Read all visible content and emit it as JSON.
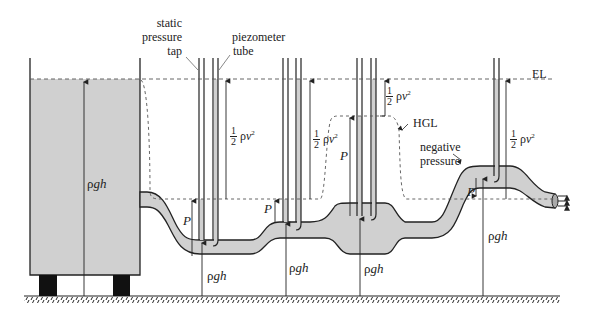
{
  "diagram": {
    "title": "",
    "type": "fluid flow pressure diagram",
    "labels": {
      "static_pressure_tap": [
        "static",
        "pressure",
        "tap"
      ],
      "piezometer_tube": [
        "piezometer",
        "tube"
      ],
      "energy_line": "EL",
      "hydraulic_grade_line": "HGL",
      "negative_pressure": [
        "negative",
        "pressure"
      ],
      "pressure_symbol": "P",
      "hydrostatic": {
        "rho": "ρ",
        "g": "g",
        "h": "h"
      },
      "dynamic": {
        "half_num": "1",
        "half_den": "2",
        "rho": "ρ",
        "v": "v",
        "exp": "2"
      }
    },
    "colors": {
      "fluid_fill": "#d0d0d0",
      "line": "#222222",
      "dashed": "#555555",
      "background": "#ffffff",
      "legs": "#111111"
    },
    "stations": [
      {
        "id": 1,
        "name": "tank",
        "term": "ρgh"
      },
      {
        "id": 2,
        "name": "low-pipe",
        "terms": [
          "P",
          "ρgh",
          "½ρv²"
        ]
      },
      {
        "id": 3,
        "name": "mid-pipe",
        "terms": [
          "P",
          "ρgh",
          "½ρv²"
        ]
      },
      {
        "id": 4,
        "name": "wide-section",
        "terms": [
          "P",
          "ρgh",
          "½ρv²"
        ]
      },
      {
        "id": 5,
        "name": "high-pipe",
        "terms": [
          "P",
          "ρgh",
          "½ρv²"
        ],
        "note": "negative pressure"
      }
    ]
  }
}
